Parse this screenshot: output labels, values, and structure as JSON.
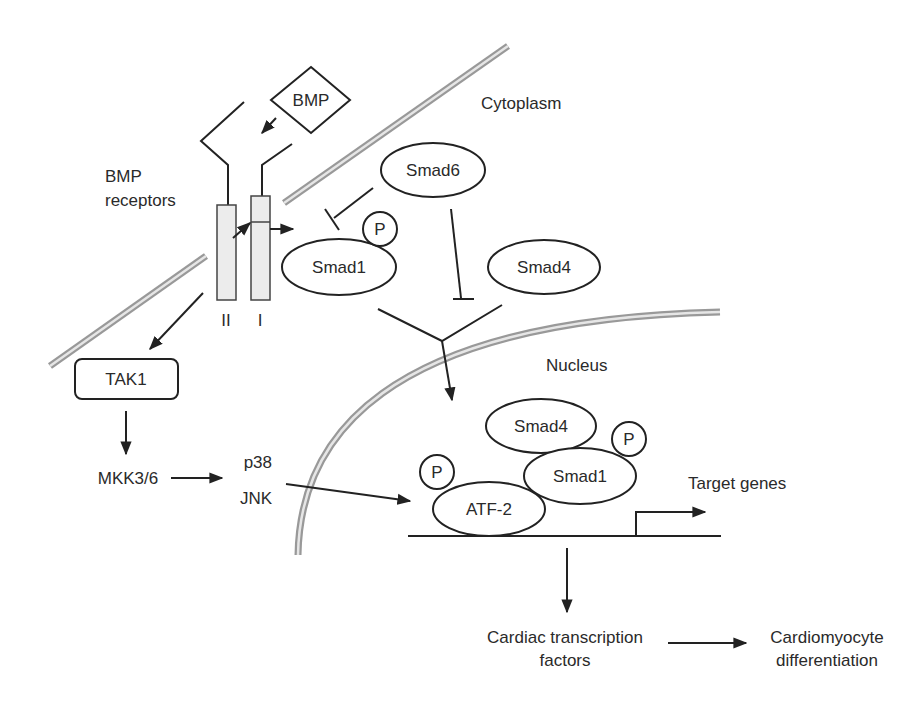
{
  "diagram": {
    "type": "signaling-pathway",
    "compartments": {
      "cytoplasm": "Cytoplasm",
      "nucleus": "Nucleus"
    },
    "ligand": "BMP",
    "receptor_label_line1": "BMP",
    "receptor_label_line2": "receptors",
    "receptor_type_II": "II",
    "receptor_type_I": "I",
    "phospho": "P",
    "nodes": {
      "smad6": "Smad6",
      "smad1_cyto": "Smad1",
      "smad4_cyto": "Smad4",
      "tak1": "TAK1",
      "mkk": "MKK3/6",
      "p38": "p38",
      "jnk": "JNK",
      "smad4_nuc": "Smad4",
      "smad1_nuc": "Smad1",
      "atf2": "ATF-2",
      "target_genes": "Target genes",
      "cardiac_tf_line1": "Cardiac transcription",
      "cardiac_tf_line2": "factors",
      "cardio_line1": "Cardiomyocyte",
      "cardio_line2": "differentiation"
    },
    "edges": [
      {
        "from": "BMP",
        "to": "BMP receptors",
        "type": "activation"
      },
      {
        "from": "Type II receptor",
        "to": "Type I receptor",
        "type": "activation"
      },
      {
        "from": "Type I receptor",
        "to": "Smad1",
        "type": "activation"
      },
      {
        "from": "Smad6",
        "to": "Smad1",
        "type": "inhibition"
      },
      {
        "from": "Smad6",
        "to": "Smad1/Smad4 complex",
        "type": "inhibition"
      },
      {
        "from": "Smad1 + Smad4",
        "to": "Nucleus",
        "type": "activation"
      },
      {
        "from": "BMP receptors",
        "to": "TAK1",
        "type": "activation"
      },
      {
        "from": "TAK1",
        "to": "MKK3/6",
        "type": "activation"
      },
      {
        "from": "MKK3/6",
        "to": "p38/JNK",
        "type": "activation"
      },
      {
        "from": "p38/JNK",
        "to": "ATF-2",
        "type": "activation"
      },
      {
        "from": "Target genes",
        "to": "Cardiac transcription factors",
        "type": "activation"
      },
      {
        "from": "Cardiac transcription factors",
        "to": "Cardiomyocyte differentiation",
        "type": "activation"
      }
    ],
    "colors": {
      "line": "#222222",
      "membrane": "#999999",
      "receptor_fill": "#ececec"
    }
  }
}
